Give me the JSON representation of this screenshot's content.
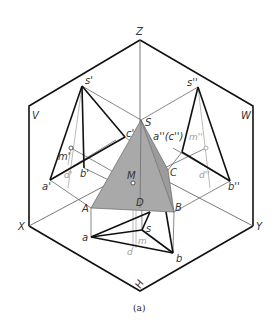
{
  "figure": {
    "caption": "(a)",
    "colors": {
      "thick_line": "#111111",
      "thin_line": "#555555",
      "hidden_gray": "#a8a8a8",
      "face_fill": "#a9a9a9"
    }
  },
  "axes": {
    "z": "Z",
    "x": "X",
    "y": "Y",
    "h_mark": "H"
  },
  "planes": {
    "v": "V",
    "w": "W",
    "h": "H"
  },
  "front_view": {
    "s": "s'",
    "a": "a'",
    "b": "b'",
    "c": "c'",
    "m": "m'",
    "d": "d'"
  },
  "side_view": {
    "s": "s''",
    "ac": "a''(c'')",
    "b": "b''",
    "m": "m''",
    "d": "d''"
  },
  "solid": {
    "s": "S",
    "a": "A",
    "b": "B",
    "c": "C",
    "d": "D",
    "m": "M"
  },
  "top_view": {
    "s": "s",
    "a": "a",
    "b": "b",
    "m": "m",
    "d": "d"
  }
}
